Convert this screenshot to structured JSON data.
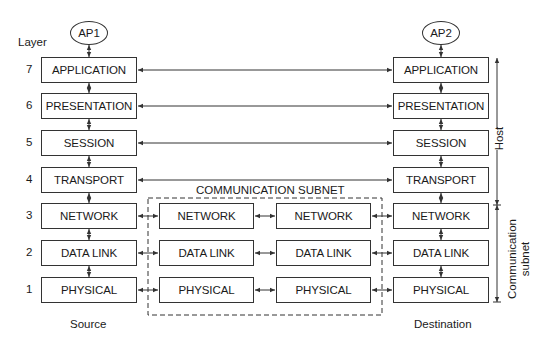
{
  "diagram": {
    "layer_header": "Layer",
    "source": {
      "app_process": "AP1",
      "caption": "Source",
      "layers": [
        {
          "number": "7",
          "name": "APPLICATION"
        },
        {
          "number": "6",
          "name": "PRESENTATION"
        },
        {
          "number": "5",
          "name": "SESSION"
        },
        {
          "number": "4",
          "name": "TRANSPORT"
        },
        {
          "number": "3",
          "name": "NETWORK"
        },
        {
          "number": "2",
          "name": "DATA LINK"
        },
        {
          "number": "1",
          "name": "PHYSICAL"
        }
      ]
    },
    "destination": {
      "app_process": "AP2",
      "caption": "Destination",
      "layers": [
        {
          "name": "APPLICATION"
        },
        {
          "name": "PRESENTATION"
        },
        {
          "name": "SESSION"
        },
        {
          "name": "TRANSPORT"
        },
        {
          "name": "NETWORK"
        },
        {
          "name": "DATA LINK"
        },
        {
          "name": "PHYSICAL"
        }
      ]
    },
    "subnet": {
      "title": "COMMUNICATION SUBNET",
      "node1": [
        "NETWORK",
        "DATA LINK",
        "PHYSICAL"
      ],
      "node2": [
        "NETWORK",
        "DATA LINK",
        "PHYSICAL"
      ]
    },
    "brackets": {
      "host": "Host",
      "subnet_line1": "Communication",
      "subnet_line2": "subnet"
    }
  }
}
